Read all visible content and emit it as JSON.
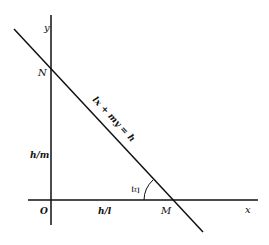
{
  "diagram": {
    "axes": {
      "x_label": "x",
      "y_label": "y",
      "origin_label": "O"
    },
    "line": {
      "equation": "lx + my = h",
      "y_intercept_point": "N",
      "x_intercept_point": "M"
    },
    "segments": {
      "on_y_axis": "h/m",
      "on_x_axis": "h/l"
    },
    "angle_label": "Ξ",
    "colors": {
      "stroke": "#111111",
      "background": "#ffffff"
    }
  }
}
